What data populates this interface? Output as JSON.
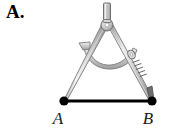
{
  "figure": {
    "problem_label": "A.",
    "background_color": "#ffffff",
    "line_color": "#000000",
    "metal_light": "#e8e8e8",
    "metal_mid": "#bdbdbd",
    "metal_dark": "#8a8a8a",
    "outline_color": "#6b6b6b"
  },
  "segment": {
    "name": "segment-ab",
    "endpoints": [
      {
        "label": "A",
        "x": 64,
        "y": 101
      },
      {
        "label": "B",
        "x": 152,
        "y": 101
      }
    ],
    "stroke_width": 3,
    "dot_radius": 4.5
  },
  "compass": {
    "pivot": {
      "x": 107,
      "y": 25,
      "radius": 5.5
    },
    "handle": {
      "x": 107,
      "y": 4,
      "width": 7,
      "height": 18
    },
    "left_leg": {
      "tip_x": 64,
      "tip_y": 101,
      "type": "needle-point"
    },
    "right_leg": {
      "tip_x": 152,
      "tip_y": 101,
      "type": "pencil-lead-point"
    },
    "arc_band": {
      "description": "curved quadrant scale between the legs"
    },
    "thumbscrew": {
      "x": 131,
      "y": 55
    },
    "knurled_clamp": {
      "x": 139,
      "y": 70
    },
    "parts": [
      "handle-knob",
      "pivot-hinge",
      "left-needle-leg",
      "right-pencil-leg",
      "arc-scale-band",
      "thumbscrew",
      "knurled-clamp"
    ]
  }
}
